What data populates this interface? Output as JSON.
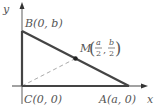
{
  "diagram": {
    "axes": {
      "x_label": "x",
      "y_label": "y"
    },
    "points": {
      "B": {
        "label": "B(0, b)"
      },
      "C": {
        "label": "C(0, 0)"
      },
      "A": {
        "label": "A(a, 0)"
      },
      "M": {
        "name": "M",
        "num1": "a",
        "den1": "2",
        "num2": "b",
        "den2": "2"
      }
    },
    "colors": {
      "axis": "#333333",
      "triangle": "#444444",
      "dashed": "#aaaaaa",
      "text": "#555555"
    }
  }
}
